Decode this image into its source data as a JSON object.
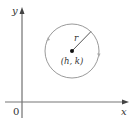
{
  "diagram": {
    "type": "circle-in-coordinate-plane",
    "axes": {
      "x_label": "x",
      "y_label": "y",
      "origin_label": "0"
    },
    "circle": {
      "center_label": "(h, k)",
      "radius_label": "r",
      "stroke_color": "#9a9a9a"
    },
    "colors": {
      "axis": "#555555",
      "text": "#333333",
      "center_dot": "#111111"
    }
  }
}
